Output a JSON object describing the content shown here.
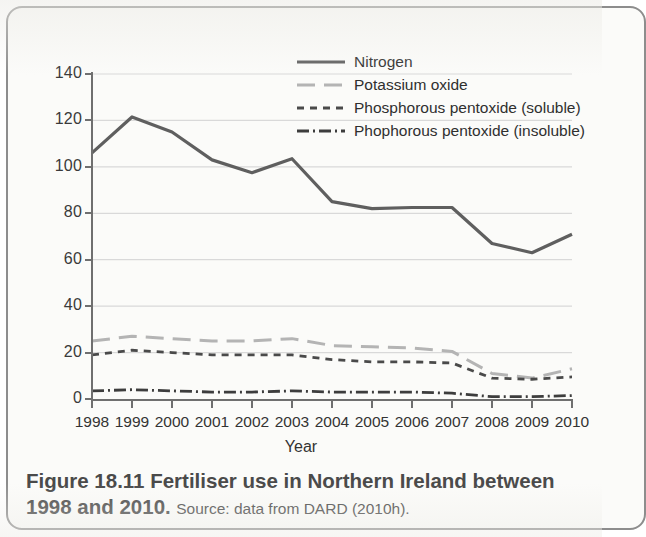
{
  "figure": {
    "caption_title": "Figure 18.11 Fertiliser use in Northern Ireland between 1998 and 2010.",
    "caption_source": "Source: data from DARD (2010h)."
  },
  "chart_data": {
    "type": "line",
    "title": "",
    "xlabel": "Year",
    "ylabel": "Quantity ('000 tonnes)",
    "categories": [
      "1998",
      "1999",
      "2000",
      "2001",
      "2002",
      "2003",
      "2004",
      "2005",
      "2006",
      "2007",
      "2008",
      "2009",
      "2010"
    ],
    "x_tick_labels": [
      "1998",
      "1999",
      "2000",
      "2001",
      "2002",
      "2003",
      "2004",
      "2005",
      "2006",
      "2007",
      "2008",
      "2009",
      "2010"
    ],
    "y_tick_labels": [
      "0",
      "20",
      "40",
      "60",
      "80",
      "100",
      "120",
      "140"
    ],
    "ylim": [
      0,
      140
    ],
    "ytick_step": 20,
    "xlim": [
      1998,
      2010
    ],
    "grid": "horizontal",
    "legend_position": "top-right-inside",
    "series": [
      {
        "name": "Nitrogen",
        "style": "solid",
        "color": "#5f5f5f",
        "values": [
          106,
          121.5,
          115,
          103,
          97.5,
          103.5,
          85,
          82,
          82.5,
          82.5,
          67,
          63,
          71
        ]
      },
      {
        "name": "Potassium oxide",
        "style": "long-dash",
        "color": "#b4b4b4",
        "values": [
          25,
          27,
          26,
          25,
          25,
          26,
          23,
          22.5,
          22,
          20.5,
          11,
          9,
          13
        ]
      },
      {
        "name": "Phosphorous pentoxide (soluble)",
        "style": "dashed",
        "color": "#4a4a4a",
        "values": [
          19,
          21,
          20,
          19,
          19,
          19,
          17,
          16,
          16,
          15.5,
          9,
          8.5,
          9.5
        ]
      },
      {
        "name": "Phophorous pentoxide (insoluble)",
        "style": "dash-dot",
        "color": "#3d3d3d",
        "values": [
          3.5,
          4,
          3.5,
          3,
          3,
          3.5,
          3,
          3,
          3,
          2.5,
          1,
          1,
          1.5
        ]
      }
    ]
  }
}
